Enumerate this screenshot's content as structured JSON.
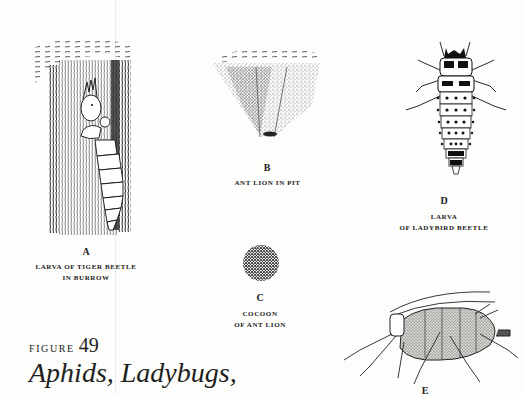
{
  "figure": {
    "label": "FIGURE",
    "number": "49",
    "title": "Aphids, Ladybugs,"
  },
  "illustrations": [
    {
      "id": "A",
      "letter": "A",
      "caption_lines": [
        "LARVA OF TIGER BEETLE",
        "IN BURROW"
      ],
      "icon": "tiger-beetle-larva-burrow"
    },
    {
      "id": "B",
      "letter": "B",
      "caption_lines": [
        "ANT LION IN PIT"
      ],
      "icon": "ant-lion-pit"
    },
    {
      "id": "C",
      "letter": "C",
      "caption_lines": [
        "COCOON",
        "OF ANT LION"
      ],
      "icon": "ant-lion-cocoon"
    },
    {
      "id": "D",
      "letter": "D",
      "caption_lines": [
        "LARVA",
        "OF LADYBIRD BEETLE"
      ],
      "icon": "ladybird-larva"
    },
    {
      "id": "E",
      "letter": "E",
      "caption_lines": [],
      "icon": "aphid"
    }
  ],
  "colors": {
    "paper": "#fdfdfb",
    "ink": "#1a1a1a",
    "stipple": "#555555"
  }
}
